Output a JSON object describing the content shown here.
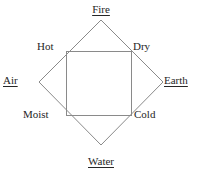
{
  "diagram": {
    "stroke_color": "#8a8a8a",
    "text_color": "#262626",
    "background_color": "#ffffff",
    "elements": [
      {
        "id": "fire",
        "label": "Fire",
        "position": "top"
      },
      {
        "id": "air",
        "label": "Air",
        "position": "left"
      },
      {
        "id": "earth",
        "label": "Earth",
        "position": "right"
      },
      {
        "id": "water",
        "label": "Water",
        "position": "bottom"
      }
    ],
    "qualities": [
      {
        "id": "hot",
        "label": "Hot",
        "position": "top-left"
      },
      {
        "id": "dry",
        "label": "Dry",
        "position": "top-right"
      },
      {
        "id": "moist",
        "label": "Moist",
        "position": "bottom-left"
      },
      {
        "id": "cold",
        "label": "Cold",
        "position": "bottom-right"
      }
    ],
    "shapes": {
      "diamond": {
        "name": "outer-diamond",
        "points": "101,20 163,82 101,145 39,82"
      },
      "square": {
        "name": "inner-square",
        "x": 66,
        "y": 51,
        "width": 65,
        "height": 64
      }
    }
  }
}
